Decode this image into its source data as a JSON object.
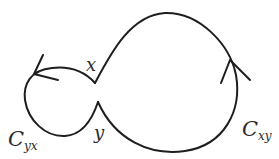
{
  "diagram": {
    "type": "contour-loops",
    "colors": {
      "stroke": "#1e1e1e",
      "text": "#2b2b2b",
      "background": "#ffffff"
    },
    "points": [
      {
        "id": "x",
        "label": "x"
      },
      {
        "id": "y",
        "label": "y"
      }
    ],
    "curves": [
      {
        "id": "C_yx",
        "label_main": "C",
        "label_sub": "yx",
        "direction": "counterclockwise arrow on upper-left"
      },
      {
        "id": "C_xy",
        "label_main": "C",
        "label_sub": "xy",
        "direction": "upward arrow on right side"
      }
    ]
  }
}
